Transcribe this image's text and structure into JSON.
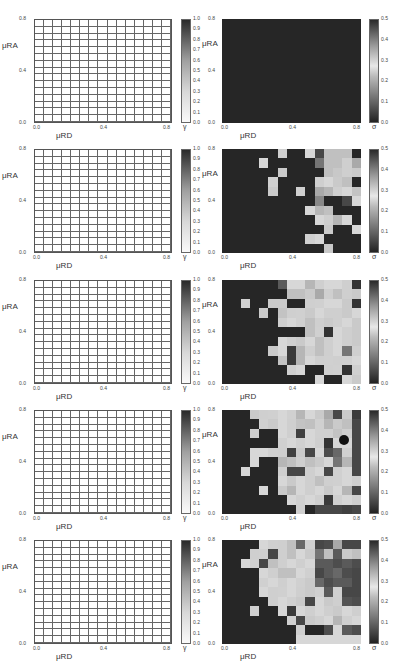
{
  "figure": {
    "rows": 5,
    "left_panel": {
      "xlabel": "μRD",
      "ylabel": "μRA",
      "colorbar_label": "γ",
      "colorbar_ticks": [
        "0.0",
        "0.1",
        "0.2",
        "0.3",
        "0.4",
        "0.5",
        "0.6",
        "0.7",
        "0.8",
        "0.9",
        "1.0"
      ]
    },
    "right_panel": {
      "xlabel": "μRD",
      "ylabel": "μRA",
      "colorbar_label": "σ",
      "colorbar_ticks": [
        "0.0",
        "0.1",
        "0.2",
        "0.3",
        "0.4",
        "0.5"
      ]
    },
    "x_ticks": [
      "0.0",
      "0.4",
      "0.8"
    ],
    "y_ticks": [
      "0.0",
      "0.4",
      "0.8"
    ]
  },
  "chart_data": [
    {
      "type": "heatmap",
      "panel": "row1-left",
      "title": "",
      "xlabel": "μRD",
      "ylabel": "μRA",
      "colorbar": "γ",
      "vrange": [
        0,
        1
      ],
      "xlim": [
        0,
        0.8
      ],
      "ylim": [
        0,
        0.8
      ],
      "grid": [
        15,
        15
      ],
      "uniform_value": 0.0
    },
    {
      "type": "heatmap",
      "panel": "row1-right",
      "title": "",
      "xlabel": "μRD",
      "ylabel": "μRA",
      "colorbar": "σ",
      "vrange": [
        0,
        0.5
      ],
      "xlim": [
        0,
        0.8
      ],
      "ylim": [
        0,
        0.8
      ],
      "grid": [
        15,
        11
      ],
      "values": [
        [
          0,
          0,
          0,
          0,
          0,
          0,
          0,
          0,
          0,
          0,
          0,
          0,
          0,
          0,
          0
        ],
        [
          0,
          0,
          0,
          0,
          0,
          0,
          0,
          0,
          0,
          0,
          0,
          0,
          0,
          0,
          0
        ],
        [
          0,
          0,
          0,
          0,
          0,
          0,
          0,
          0,
          0,
          0,
          0,
          0,
          0,
          0,
          0
        ],
        [
          0,
          0,
          0,
          0,
          0,
          0,
          0,
          0,
          0,
          0,
          0,
          0,
          0,
          0,
          0
        ],
        [
          0,
          0,
          0,
          0,
          0,
          0,
          0,
          0,
          0,
          0,
          0,
          0,
          0,
          0,
          0
        ],
        [
          0,
          0,
          0,
          0,
          0,
          0,
          0,
          0,
          0,
          0,
          0,
          0,
          0,
          0,
          0
        ],
        [
          0,
          0,
          0,
          0,
          0,
          0,
          0,
          0,
          0,
          0,
          0,
          0,
          0,
          0,
          0
        ],
        [
          0,
          0,
          0,
          0,
          0,
          0,
          0,
          0,
          0,
          0,
          0,
          0,
          0,
          0,
          0
        ],
        [
          0,
          0,
          0,
          0,
          0,
          0,
          0,
          0,
          0,
          0,
          0,
          0,
          0,
          0,
          0
        ],
        [
          0,
          0,
          0,
          0,
          0,
          0,
          0,
          0,
          0,
          0,
          0,
          0,
          0,
          0,
          0
        ],
        [
          0,
          0,
          0,
          0,
          0,
          0,
          0,
          0,
          0,
          0,
          0,
          0,
          0,
          0,
          0
        ]
      ]
    },
    {
      "type": "heatmap",
      "panel": "row2-left",
      "xlabel": "μRD",
      "ylabel": "μRA",
      "colorbar": "γ",
      "vrange": [
        0,
        1
      ],
      "grid": [
        15,
        15
      ],
      "uniform_value": 0.0
    },
    {
      "type": "heatmap",
      "panel": "row2-right",
      "xlabel": "μRD",
      "ylabel": "μRA",
      "colorbar": "σ",
      "vrange": [
        0,
        0.5
      ],
      "grid": [
        15,
        11
      ],
      "values": [
        [
          0,
          0,
          0,
          0,
          0,
          0,
          0.28,
          0,
          0,
          0.27,
          0.05,
          0.3,
          0.3,
          0.3,
          0
        ],
        [
          0,
          0,
          0,
          0,
          0.27,
          0,
          0,
          0,
          0,
          0,
          0.12,
          0.3,
          0.3,
          0.28,
          0.2
        ],
        [
          0,
          0,
          0,
          0,
          0,
          0,
          0.25,
          0,
          0,
          0,
          0,
          0.3,
          0.29,
          0.28,
          0.25
        ],
        [
          0,
          0,
          0,
          0,
          0,
          0.26,
          0,
          0,
          0,
          0,
          0.28,
          0.27,
          0.25,
          0.3,
          0
        ],
        [
          0,
          0,
          0,
          0,
          0,
          0.25,
          0,
          0,
          0.26,
          0,
          0.2,
          0.22,
          0.28,
          0.27,
          0.24
        ],
        [
          0,
          0,
          0,
          0,
          0,
          0,
          0,
          0,
          0,
          0,
          0.15,
          0,
          0,
          0.05,
          0.27
        ],
        [
          0,
          0,
          0,
          0,
          0,
          0,
          0,
          0,
          0,
          0.27,
          0.22,
          0.3,
          0,
          0,
          0
        ],
        [
          0,
          0,
          0,
          0,
          0,
          0,
          0,
          0,
          0,
          0,
          0.27,
          0.28,
          0.22,
          0.27,
          0
        ],
        [
          0,
          0,
          0,
          0,
          0,
          0,
          0,
          0,
          0,
          0,
          0,
          0.25,
          0,
          0,
          0.27
        ],
        [
          0,
          0,
          0,
          0,
          0,
          0,
          0,
          0,
          0,
          0.26,
          0.27,
          0,
          0,
          0,
          0
        ],
        [
          0,
          0,
          0,
          0,
          0,
          0,
          0,
          0,
          0,
          0,
          0,
          0.29,
          0,
          0,
          0
        ]
      ]
    },
    {
      "type": "heatmap",
      "panel": "row3-left",
      "xlabel": "μRD",
      "ylabel": "μRA",
      "colorbar": "γ",
      "vrange": [
        0,
        1
      ],
      "grid": [
        15,
        15
      ],
      "uniform_value": 0.0
    },
    {
      "type": "heatmap",
      "panel": "row3-right",
      "xlabel": "μRD",
      "ylabel": "μRA",
      "colorbar": "σ",
      "vrange": [
        0,
        0.5
      ],
      "grid": [
        15,
        11
      ],
      "values": [
        [
          0,
          0,
          0,
          0,
          0,
          0,
          0.08,
          0.27,
          0.27,
          0.22,
          0.28,
          0.27,
          0.27,
          0.28,
          0.02
        ],
        [
          0,
          0,
          0,
          0,
          0,
          0,
          0,
          0.3,
          0.3,
          0.25,
          0.2,
          0.28,
          0.3,
          0.28,
          0.25
        ],
        [
          0,
          0,
          0.26,
          0,
          0,
          0.25,
          0.25,
          0,
          0,
          0.28,
          0.26,
          0.27,
          0.27,
          0.25,
          0.02
        ],
        [
          0,
          0,
          0,
          0,
          0.25,
          0,
          0.24,
          0.28,
          0.26,
          0.25,
          0.27,
          0.28,
          0.28,
          0.25,
          0.27
        ],
        [
          0,
          0,
          0,
          0,
          0,
          0,
          0.28,
          0.27,
          0.26,
          0.3,
          0.28,
          0.25,
          0.28,
          0.27,
          0.25
        ],
        [
          0,
          0,
          0,
          0,
          0,
          0,
          0,
          0,
          0,
          0.3,
          0.26,
          0.02,
          0.27,
          0.28,
          0.25
        ],
        [
          0,
          0,
          0,
          0,
          0,
          0,
          0.27,
          0.28,
          0.25,
          0.27,
          0.3,
          0.28,
          0.27,
          0.28,
          0.25
        ],
        [
          0,
          0,
          0,
          0,
          0,
          0.25,
          0.27,
          0.03,
          0.22,
          0.28,
          0.3,
          0.28,
          0.27,
          0.12,
          0.28
        ],
        [
          0,
          0,
          0,
          0,
          0,
          0,
          0.24,
          0.03,
          0.22,
          0.27,
          0.28,
          0.26,
          0.28,
          0.26,
          0.27
        ],
        [
          0,
          0,
          0,
          0,
          0,
          0,
          0,
          0.26,
          0.27,
          0,
          0,
          0.28,
          0.26,
          0.02,
          0.28
        ],
        [
          0,
          0,
          0,
          0,
          0,
          0,
          0,
          0,
          0,
          0,
          0.27,
          0,
          0,
          0.27,
          0.25
        ]
      ]
    },
    {
      "type": "heatmap",
      "panel": "row4-left",
      "xlabel": "μRD",
      "ylabel": "μRA",
      "colorbar": "γ",
      "vrange": [
        0,
        1
      ],
      "grid": [
        15,
        15
      ],
      "uniform_value": 0.0
    },
    {
      "type": "heatmap",
      "panel": "row4-right",
      "xlabel": "μRD",
      "ylabel": "μRA",
      "colorbar": "σ",
      "vrange": [
        0,
        0.5
      ],
      "grid": [
        15,
        11
      ],
      "values": [
        [
          0,
          0,
          0,
          0.25,
          0.28,
          0.26,
          0.27,
          0.26,
          0.22,
          0.27,
          0.25,
          0.2,
          0.05,
          0.25,
          0.03
        ],
        [
          0,
          0,
          0,
          0,
          0.26,
          0.25,
          0.27,
          0.28,
          0.24,
          0.3,
          0.26,
          0.22,
          0.25,
          0.3,
          0.05
        ],
        [
          0,
          0,
          0,
          0.28,
          0,
          0,
          0.27,
          0.28,
          0.04,
          0.27,
          0.26,
          0.26,
          0.24,
          0.28,
          0.05
        ],
        [
          0,
          0,
          0,
          0,
          0,
          0,
          0.26,
          0.27,
          0.26,
          0.27,
          0.28,
          0.02,
          0.27,
          0.27,
          0.05
        ],
        [
          0,
          0,
          0,
          0.27,
          0.27,
          0.26,
          0.28,
          0.04,
          0.25,
          0.05,
          0.27,
          0.06,
          0.1,
          0.26,
          0.05
        ],
        [
          0,
          0,
          0,
          0.27,
          0,
          0,
          0.22,
          0.3,
          0.28,
          0.3,
          0.25,
          0.27,
          0.12,
          0.22,
          0.05
        ],
        [
          0,
          0,
          0.27,
          0,
          0,
          0,
          0.28,
          0.05,
          0.05,
          0.28,
          0.27,
          0.05,
          0.26,
          0.27,
          0.05
        ],
        [
          0,
          0,
          0,
          0,
          0,
          0,
          0.27,
          0.25,
          0.27,
          0.28,
          0.3,
          0.28,
          0.26,
          0.27,
          0.28
        ],
        [
          0,
          0,
          0,
          0,
          0.27,
          0,
          0.25,
          0.22,
          0.27,
          0.28,
          0.27,
          0.25,
          0.27,
          0.22,
          0.05
        ],
        [
          0,
          0,
          0,
          0,
          0,
          0,
          0,
          0.27,
          0.26,
          0.27,
          0.28,
          0.03,
          0.26,
          0.27,
          0.28
        ],
        [
          0,
          0,
          0,
          0,
          0,
          0,
          0,
          0,
          0.28,
          0,
          0.05,
          0.05,
          0.05,
          0.04,
          0.05
        ]
      ]
    },
    {
      "type": "heatmap",
      "panel": "row5-left",
      "xlabel": "μRD",
      "ylabel": "μRA",
      "colorbar": "γ",
      "vrange": [
        0,
        1
      ],
      "grid": [
        15,
        15
      ],
      "uniform_value": 0.0
    },
    {
      "type": "heatmap",
      "panel": "row5-right",
      "xlabel": "μRD",
      "ylabel": "μRA",
      "colorbar": "σ",
      "vrange": [
        0,
        0.5
      ],
      "grid": [
        15,
        11
      ],
      "values": [
        [
          0,
          0,
          0,
          0,
          0.27,
          0.26,
          0.28,
          0.3,
          0.1,
          0.26,
          0.05,
          0.06,
          0.2,
          0.05,
          0.05
        ],
        [
          0,
          0,
          0,
          0.28,
          0.26,
          0.05,
          0.28,
          0.3,
          0.27,
          0.25,
          0.12,
          0.3,
          0.08,
          0.25,
          0.3
        ],
        [
          0,
          0,
          0.27,
          0.26,
          0.05,
          0.3,
          0.28,
          0.27,
          0.28,
          0.27,
          0.08,
          0.08,
          0.06,
          0.08,
          0.06
        ],
        [
          0,
          0,
          0,
          0,
          0.27,
          0.28,
          0.3,
          0.3,
          0.27,
          0.26,
          0.05,
          0.08,
          0.1,
          0.06,
          0.05
        ],
        [
          0,
          0,
          0,
          0,
          0.26,
          0.27,
          0.28,
          0.27,
          0.26,
          0.25,
          0.1,
          0.06,
          0.08,
          0.08,
          0.05
        ],
        [
          0,
          0,
          0,
          0,
          0.27,
          0.28,
          0.26,
          0.27,
          0.28,
          0.25,
          0.26,
          0.08,
          0.26,
          0.05,
          0.05
        ],
        [
          0,
          0,
          0,
          0,
          0,
          0.28,
          0.27,
          0.26,
          0.25,
          0.05,
          0.27,
          0.25,
          0.28,
          0.07,
          0.06
        ],
        [
          0,
          0,
          0,
          0.26,
          0,
          0,
          0.27,
          0.03,
          0.27,
          0.28,
          0.27,
          0.28,
          0.25,
          0.27,
          0.28
        ],
        [
          0,
          0,
          0,
          0,
          0,
          0,
          0,
          0.26,
          0.05,
          0.25,
          0.28,
          0.27,
          0.22,
          0.26,
          0.27
        ],
        [
          0,
          0,
          0,
          0,
          0,
          0,
          0,
          0,
          0.28,
          0,
          0,
          0.06,
          0.27,
          0.08,
          0.06
        ],
        [
          0,
          0,
          0,
          0,
          0,
          0,
          0,
          0,
          0.27,
          0.27,
          0.27,
          0.27,
          0.27,
          0.27,
          0.27
        ]
      ]
    }
  ]
}
